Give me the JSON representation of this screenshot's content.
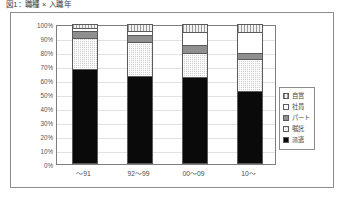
{
  "figure": {
    "title": "図1：職種 × 入職年"
  },
  "chart_data": {
    "type": "bar",
    "stacked": true,
    "normalized_percent": true,
    "title": "図1：職種 × 入職年",
    "xlabel": "",
    "ylabel": "",
    "ylim": [
      0,
      100
    ],
    "ytick_labels": [
      "100%",
      "90%",
      "80%",
      "70%",
      "60%",
      "50%",
      "40%",
      "30%",
      "20%",
      "10%",
      "0%"
    ],
    "ytick_values": [
      100,
      90,
      80,
      70,
      60,
      50,
      40,
      30,
      20,
      10,
      0
    ],
    "grid": true,
    "legend_position": "right",
    "categories": [
      "〜91",
      "92〜99",
      "00〜09",
      "10〜"
    ],
    "series": [
      {
        "name": "派遣",
        "key": "haken",
        "swatch": "solid-black",
        "color": "#0a0a0a",
        "values": [
          68,
          63,
          62,
          52
        ]
      },
      {
        "name": "嘱託",
        "key": "shokutaku",
        "swatch": "light-check",
        "color": "#d2d2d2",
        "values": [
          22,
          24,
          17,
          23
        ]
      },
      {
        "name": "パート",
        "key": "part",
        "swatch": "dark-gray",
        "color": "#8f8f8f",
        "values": [
          5,
          5,
          6,
          4
        ]
      },
      {
        "name": "社員",
        "key": "shain",
        "swatch": "white",
        "color": "#ffffff",
        "values": [
          2,
          3,
          9,
          15
        ]
      },
      {
        "name": "自営",
        "key": "jiei",
        "swatch": "vert-hatch",
        "color": "#d8d8d8",
        "values": [
          3,
          5,
          6,
          6
        ]
      }
    ]
  },
  "legend": {
    "items": [
      {
        "label": "自営",
        "key": "jiei"
      },
      {
        "label": "社員",
        "key": "shain"
      },
      {
        "label": "パート",
        "key": "part"
      },
      {
        "label": "嘱託",
        "key": "shokutaku"
      },
      {
        "label": "派遣",
        "key": "haken"
      }
    ]
  }
}
